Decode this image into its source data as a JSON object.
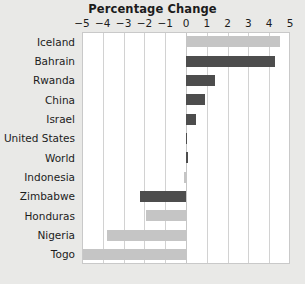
{
  "chart_data": {
    "type": "bar",
    "orientation": "horizontal",
    "title": "Percentage Change",
    "xlabel": "",
    "ylabel": "",
    "xlim": [
      -5,
      5
    ],
    "grid": true,
    "legend": "none",
    "xticks": [
      "−5",
      "−4",
      "−3",
      "−2",
      "−1",
      "0",
      "1",
      "2",
      "3",
      "4",
      "5"
    ],
    "xtick_values": [
      -5,
      -4,
      -3,
      -2,
      -1,
      0,
      1,
      2,
      3,
      4,
      5
    ],
    "categories": [
      "Iceland",
      "Bahrain",
      "Rwanda",
      "China",
      "Israel",
      "United States",
      "World",
      "Indonesia",
      "Zimbabwe",
      "Honduras",
      "Nigeria",
      "Togo"
    ],
    "values": [
      4.5,
      4.3,
      1.4,
      0.9,
      0.5,
      0.0,
      0.1,
      -0.1,
      -2.2,
      -1.9,
      -3.8,
      -5.0
    ],
    "bar_colors": [
      "light",
      "dark",
      "dark",
      "dark",
      "dark",
      "dark",
      "dark",
      "light",
      "dark",
      "light",
      "light",
      "light"
    ],
    "colors": {
      "light_bar": "#c5c5c5",
      "dark_bar": "#4d4d4d",
      "background": "#e9e9e7",
      "plot_background": "#ffffff",
      "gridline": "#d2d2d2",
      "text": "#1c1c1c"
    }
  }
}
